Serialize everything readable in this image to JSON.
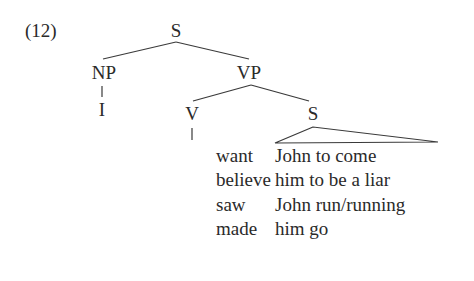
{
  "example_number": "(12)",
  "tree": {
    "root": "S",
    "np": "NP",
    "np_child": "I",
    "vp": "VP",
    "v": "V",
    "s_embedded": "S"
  },
  "rows": [
    {
      "verb": "want",
      "complement": "John to come"
    },
    {
      "verb": "believe",
      "complement": "him to be a liar"
    },
    {
      "verb": "saw",
      "complement": "John run/running"
    },
    {
      "verb": "made",
      "complement": "him go"
    }
  ]
}
